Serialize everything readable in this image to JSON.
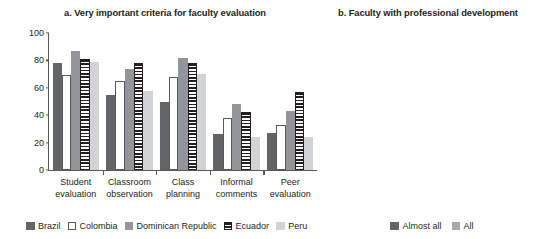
{
  "chart_data": [
    {
      "type": "bar",
      "title": "a. Very important criteria for faculty evaluation",
      "xlabel": "",
      "ylabel": "Percent",
      "ylim": [
        0,
        100
      ],
      "yticks": [
        0,
        20,
        40,
        60,
        80,
        100
      ],
      "grid": false,
      "legend_position": "bottom",
      "categories": [
        "Student evaluation",
        "Classroom observation",
        "Class planning",
        "Informal comments",
        "Peer evaluation"
      ],
      "categories_lines": [
        [
          "Student",
          "evaluation"
        ],
        [
          "Classroom",
          "observation"
        ],
        [
          "Class",
          "planning"
        ],
        [
          "Informal",
          "comments"
        ],
        [
          "Peer",
          "evaluation"
        ]
      ],
      "series": [
        {
          "name": "Brazil",
          "color": "#636466",
          "pattern": "solid-dark",
          "values": [
            78,
            55,
            50,
            26,
            27
          ]
        },
        {
          "name": "Colombia",
          "color": "#ffffff",
          "pattern": "outline",
          "values": [
            69,
            65,
            68,
            38,
            33
          ]
        },
        {
          "name": "Dominican Republic",
          "color": "#939598",
          "pattern": "solid-mid",
          "values": [
            87,
            74,
            82,
            48,
            43
          ]
        },
        {
          "name": "Ecuador",
          "color": "#231f20",
          "pattern": "horizontal-stripes",
          "values": [
            81,
            78,
            78,
            42,
            57
          ]
        },
        {
          "name": "Peru",
          "color": "#d1d3d4",
          "pattern": "solid-light",
          "values": [
            79,
            58,
            70,
            24,
            24
          ]
        }
      ]
    },
    {
      "type": "bar",
      "subtype": "stacked",
      "title": "b. Faculty with professional development",
      "xlabel": "",
      "ylabel": "Percent",
      "ylim": [
        0,
        100
      ],
      "yticks": [
        0,
        20,
        40,
        60,
        80,
        100
      ],
      "grid": false,
      "legend_position": "bottom",
      "categories": [
        "ECU",
        "BRA",
        "PER",
        "COL",
        "DR"
      ],
      "series": [
        {
          "name": "All",
          "color": "#a7a9ac",
          "values": [
            44,
            37,
            13,
            12,
            8
          ]
        },
        {
          "name": "Almost all",
          "color": "#636466",
          "values": [
            27,
            30,
            52,
            34,
            32
          ]
        }
      ],
      "totals": [
        71,
        67,
        65,
        46,
        40
      ]
    }
  ]
}
